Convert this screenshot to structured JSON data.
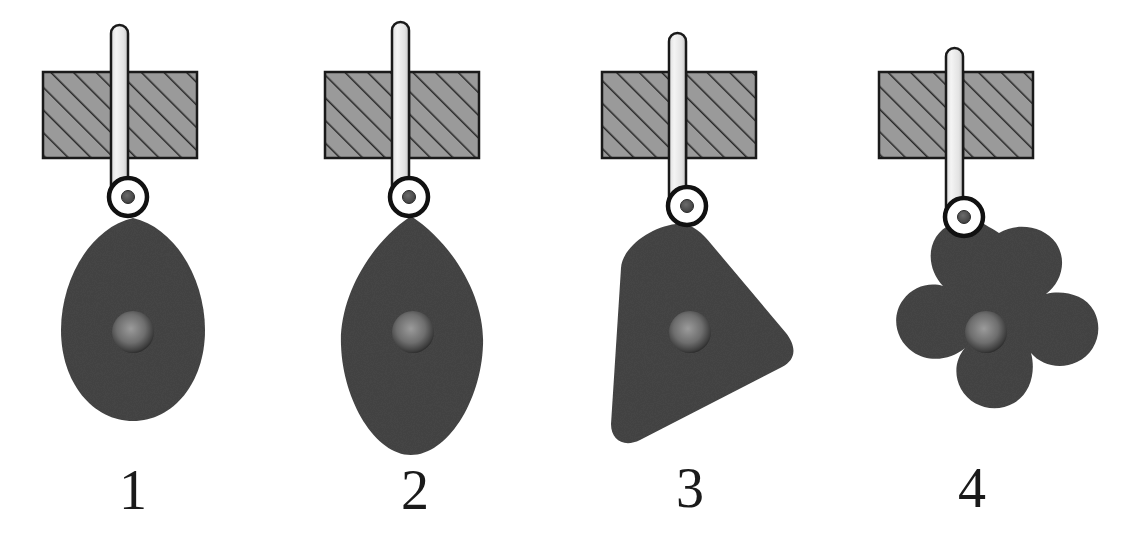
{
  "figure": {
    "background_color": "#ffffff",
    "width": 1137,
    "height": 541
  },
  "palette": {
    "cam_fill": "#454545",
    "cam_hub_center": "#8d8d8d",
    "cam_hub_edge": "#3a3a3a",
    "block_fill": "#9a9a9a",
    "block_hatch": "#262626",
    "block_outline": "#1a1a1a",
    "rod_light": "#f2f2f2",
    "rod_shade": "#c9c9c9",
    "rod_outline": "#1a1a1a",
    "roller_ring": "#111111",
    "roller_inner": "#ffffff",
    "roller_pin": "#4e4e4e",
    "label_color": "#1a1a1a"
  },
  "mechanisms": [
    {
      "id": "mechanism-1",
      "label": "1",
      "cam_shape_name": "egg-teardrop-cam",
      "cam_description": "Egg / teardrop cam profile, pointed apex up, rounded base",
      "center_x": 133,
      "label_x": 88,
      "label_y": 462,
      "rod_x": 119,
      "rod_top": 25,
      "rod_bottom": 198,
      "rod_width": 17,
      "block_x": 43,
      "block_y": 72,
      "block_width": 154,
      "block_height": 86,
      "roller_cx": 128,
      "roller_cy": 197,
      "roller_outer_r": 19,
      "roller_inner_r": 12,
      "roller_pin_r": 6,
      "hub_cx": 133,
      "hub_cy": 332,
      "hub_r": 21
    },
    {
      "id": "mechanism-2",
      "label": "2",
      "cam_shape_name": "lens-oval-cam",
      "cam_description": "Pointed oval / lens cam profile, apexes top and bottom",
      "center_x": 413,
      "label_x": 370,
      "label_y": 462,
      "rod_x": 400,
      "rod_top": 22,
      "rod_bottom": 198,
      "rod_width": 17,
      "block_x": 325,
      "block_y": 72,
      "block_width": 154,
      "block_height": 86,
      "roller_cx": 409,
      "roller_cy": 197,
      "roller_outer_r": 19,
      "roller_inner_r": 12,
      "roller_pin_r": 6,
      "hub_cx": 413,
      "hub_cy": 332,
      "hub_r": 21
    },
    {
      "id": "mechanism-3",
      "label": "3",
      "cam_shape_name": "rounded-triangle-cam",
      "cam_description": "Rounded triangular cam profile, apex up and tilted",
      "center_x": 690,
      "label_x": 645,
      "label_y": 460,
      "rod_x": 678,
      "rod_top": 33,
      "rod_bottom": 206,
      "rod_width": 17,
      "block_x": 602,
      "block_y": 72,
      "block_width": 154,
      "block_height": 86,
      "roller_cx": 687,
      "roller_cy": 206,
      "roller_outer_r": 19,
      "roller_inner_r": 12,
      "roller_pin_r": 6,
      "hub_cx": 690,
      "hub_cy": 332,
      "hub_r": 21
    },
    {
      "id": "mechanism-4",
      "label": "4",
      "cam_shape_name": "four-lobe-clover-cam",
      "cam_description": "Four-lobed clover / flower cam profile",
      "center_x": 986,
      "label_x": 927,
      "label_y": 460,
      "rod_x": 955,
      "rod_top": 48,
      "rod_bottom": 218,
      "rod_width": 17,
      "block_x": 879,
      "block_y": 72,
      "block_width": 154,
      "block_height": 86,
      "roller_cx": 964,
      "roller_cy": 217,
      "roller_outer_r": 19,
      "roller_inner_r": 12,
      "roller_pin_r": 6,
      "hub_cx": 986,
      "hub_cy": 332,
      "hub_r": 21
    }
  ]
}
